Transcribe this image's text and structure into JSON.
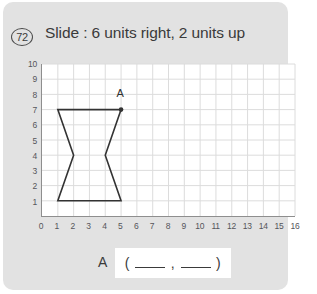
{
  "card": {
    "background_color": "#e2e2e2",
    "page_background": "#ffffff"
  },
  "header": {
    "question_number": "72",
    "title": "Slide : 6 units right, 2 units up"
  },
  "answer": {
    "label": "A",
    "open_paren": "(",
    "comma": ",",
    "close_paren": ")",
    "blank_x": "",
    "blank_y": ""
  },
  "chart_data": {
    "type": "scatter",
    "title": "Slide : 6 units right, 2 units up",
    "xlabel": "",
    "ylabel": "",
    "xlim": [
      0,
      16
    ],
    "ylim": [
      0,
      10
    ],
    "grid": true,
    "legend": "none",
    "x_ticks": [
      "0",
      "1",
      "2",
      "3",
      "4",
      "5",
      "6",
      "7",
      "8",
      "9",
      "10",
      "11",
      "12",
      "13",
      "14",
      "15",
      "16"
    ],
    "y_ticks": [
      "1",
      "2",
      "3",
      "4",
      "5",
      "6",
      "7",
      "8",
      "9",
      "10"
    ],
    "grid_color": "#dcdcdc",
    "axis_color": "#8e8e8e",
    "shape_color": "#333333",
    "shapes": [
      {
        "name": "hourglass-polygon",
        "closed": true,
        "vertices": [
          [
            1,
            7
          ],
          [
            5,
            7
          ],
          [
            4,
            4
          ],
          [
            5,
            1
          ],
          [
            1,
            1
          ],
          [
            2,
            4
          ]
        ]
      }
    ],
    "points": [
      {
        "label": "A",
        "x": 5,
        "y": 7,
        "marker": "dot",
        "label_dx": 0,
        "label_dy": 1
      }
    ]
  }
}
